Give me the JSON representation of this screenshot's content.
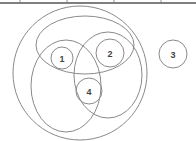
{
  "diagram": {
    "type": "venn-set-diagram",
    "colors": {
      "stroke": "#8a8a8a",
      "label": "#444444",
      "top_line": "#555555",
      "background": "#ffffff"
    },
    "top_border": {
      "y": 3,
      "ticks_x": [
        20,
        67,
        114,
        161
      ]
    },
    "outer_circle": {
      "cx": 80,
      "cy": 73,
      "rx": 67,
      "ry": 67
    },
    "ellipses": [
      {
        "name": "top-ellipse",
        "cx": 85,
        "cy": 45,
        "rx": 49,
        "ry": 29
      },
      {
        "name": "left-ellipse",
        "cx": 66,
        "cy": 86,
        "rx": 35,
        "ry": 46
      },
      {
        "name": "right-ellipse",
        "cx": 108,
        "cy": 75,
        "rx": 34,
        "ry": 43
      }
    ],
    "numbered_circles": [
      {
        "label": "1",
        "cx": 62,
        "cy": 58,
        "r": 11
      },
      {
        "label": "2",
        "cx": 110,
        "cy": 53,
        "r": 14
      },
      {
        "label": "3",
        "cx": 173,
        "cy": 54,
        "r": 14
      },
      {
        "label": "4",
        "cx": 89,
        "cy": 91,
        "r": 13
      }
    ]
  }
}
